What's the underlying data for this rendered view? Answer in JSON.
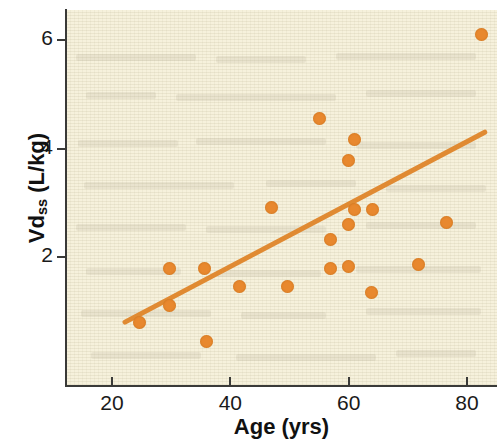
{
  "chart_data": {
    "type": "scatter",
    "title": "",
    "xlabel": "Age (yrs)",
    "ylabel_main": "Vd",
    "ylabel_sub": "ss",
    "ylabel_unit": " (L/kg)",
    "ylabel_full": "Vdss (L/kg)",
    "xlim": [
      4,
      88
    ],
    "ylim": [
      -0.15,
      6.7
    ],
    "xticks": [
      20,
      40,
      60,
      80
    ],
    "xtick_labels": [
      "20",
      "40",
      "60",
      "80"
    ],
    "yticks": [
      2,
      4,
      6
    ],
    "ytick_labels": [
      "2",
      "4",
      "6"
    ],
    "grid": false,
    "legend": null,
    "point_color": "#e8882e",
    "line_color": "#e08a32",
    "plot_background": "#f6f1dc",
    "axis_color": "#3a3a38",
    "x": [
      82.5,
      55.0,
      61.0,
      60.0,
      47.0,
      61.0,
      64.0,
      60.0,
      76.5,
      57.0,
      57.0,
      60.0,
      29.8,
      35.6,
      71.8,
      41.5,
      49.6,
      63.8,
      29.8,
      24.7,
      36.0
    ],
    "y": [
      6.1,
      4.56,
      4.16,
      3.77,
      2.92,
      2.88,
      2.88,
      2.59,
      2.63,
      2.33,
      1.78,
      1.82,
      1.78,
      1.78,
      1.87,
      1.45,
      1.45,
      1.35,
      1.1,
      0.8,
      0.45
    ],
    "points": [
      {
        "age": 82.5,
        "vdss": 6.1
      },
      {
        "age": 55.0,
        "vdss": 4.56
      },
      {
        "age": 61.0,
        "vdss": 4.16
      },
      {
        "age": 60.0,
        "vdss": 3.77
      },
      {
        "age": 47.0,
        "vdss": 2.92
      },
      {
        "age": 61.0,
        "vdss": 2.88
      },
      {
        "age": 64.0,
        "vdss": 2.88
      },
      {
        "age": 60.0,
        "vdss": 2.59
      },
      {
        "age": 76.5,
        "vdss": 2.63
      },
      {
        "age": 57.0,
        "vdss": 2.33
      },
      {
        "age": 57.0,
        "vdss": 1.78
      },
      {
        "age": 60.0,
        "vdss": 1.82
      },
      {
        "age": 29.8,
        "vdss": 1.78
      },
      {
        "age": 35.6,
        "vdss": 1.78
      },
      {
        "age": 71.8,
        "vdss": 1.87
      },
      {
        "age": 41.5,
        "vdss": 1.45
      },
      {
        "age": 49.6,
        "vdss": 1.45
      },
      {
        "age": 63.8,
        "vdss": 1.35
      },
      {
        "age": 29.8,
        "vdss": 1.1
      },
      {
        "age": 24.7,
        "vdss": 0.8
      },
      {
        "age": 36.0,
        "vdss": 0.45
      }
    ],
    "trend_line": {
      "label": "regression line",
      "x_start": 22.2,
      "y_start": 0.8,
      "x_end": 83.0,
      "y_end": 4.3
    }
  }
}
